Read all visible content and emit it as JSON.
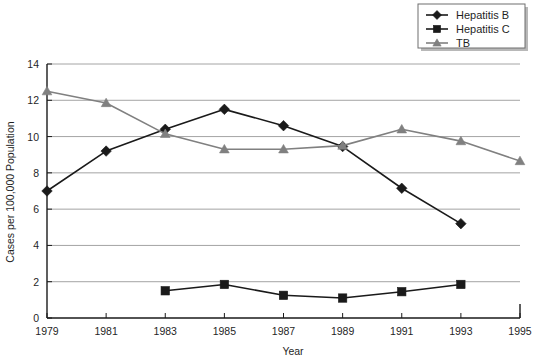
{
  "chart_data": {
    "type": "line",
    "title": "",
    "xlabel": "Year",
    "ylabel": "Cases per 100,000 Population",
    "x": [
      1979,
      1981,
      1983,
      1985,
      1987,
      1989,
      1991,
      1993,
      1995
    ],
    "xticklabels": [
      "1979",
      "1981",
      "1983",
      "1985",
      "1987",
      "1989",
      "1991",
      "1993",
      "1995"
    ],
    "yticklabels": [
      "0",
      "2",
      "4",
      "6",
      "8",
      "10",
      "12",
      "14"
    ],
    "yticks": [
      0,
      2,
      4,
      6,
      8,
      10,
      12,
      14
    ],
    "xlim": [
      1979,
      1995
    ],
    "ylim": [
      0,
      14
    ],
    "grid": "horizontal",
    "legend_position": "top-right",
    "series": [
      {
        "name": "Hepatitis B",
        "color": "#1a1a1a",
        "marker": "diamond",
        "x": [
          1979,
          1981,
          1983,
          1985,
          1987,
          1989,
          1991,
          1993
        ],
        "values": [
          7.0,
          9.2,
          10.4,
          11.5,
          10.6,
          9.45,
          7.15,
          5.2
        ]
      },
      {
        "name": "Hepatitis C",
        "color": "#1a1a1a",
        "marker": "square",
        "x": [
          1983,
          1985,
          1987,
          1989,
          1991,
          1993
        ],
        "values": [
          1.5,
          1.85,
          1.25,
          1.1,
          1.45,
          1.85
        ]
      },
      {
        "name": "TB",
        "color": "#808080",
        "marker": "triangle",
        "x": [
          1979,
          1981,
          1983,
          1985,
          1987,
          1989,
          1991,
          1993,
          1995
        ],
        "values": [
          12.5,
          11.85,
          10.15,
          9.3,
          9.3,
          9.5,
          10.4,
          9.75,
          8.65
        ]
      }
    ]
  },
  "legend": {
    "items": [
      {
        "label": "Hepatitis B"
      },
      {
        "label": "Hepatitis C"
      },
      {
        "label": "TB"
      }
    ]
  },
  "axes": {
    "x_title": "Year",
    "y_title": "Cases per 100,000 Population"
  }
}
